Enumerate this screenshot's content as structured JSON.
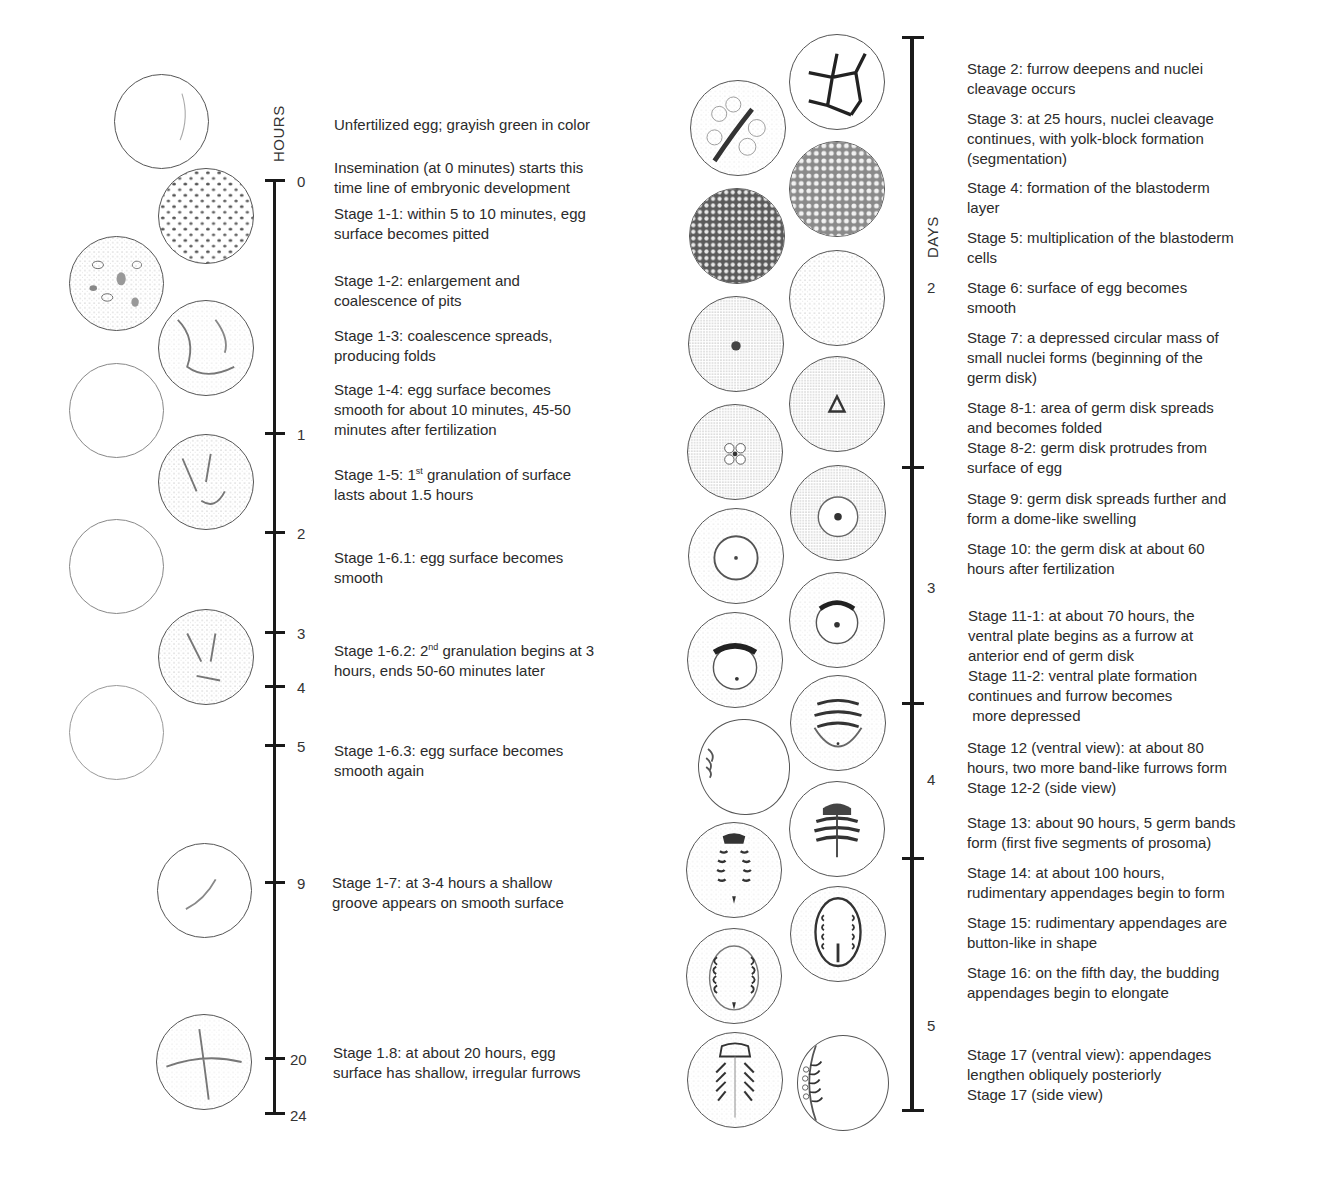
{
  "left_timeline": {
    "axis_title": "HOURS",
    "ticks": [
      {
        "label": "0",
        "y": 180
      },
      {
        "label": "1",
        "y": 433
      },
      {
        "label": "2",
        "y": 532
      },
      {
        "label": "3",
        "y": 632
      },
      {
        "label": "4",
        "y": 686
      },
      {
        "label": "5",
        "y": 745
      },
      {
        "label": "9",
        "y": 882
      },
      {
        "label": "20",
        "y": 1058
      },
      {
        "label": "24",
        "y": 1113
      }
    ],
    "descriptions": [
      {
        "id": "unfertilized",
        "lines": [
          "Unfertilized egg; grayish green in color"
        ]
      },
      {
        "id": "insemination",
        "lines": [
          "Insemination (at 0 minutes) starts this",
          "time line of embryonic development"
        ]
      },
      {
        "id": "stage-1-1",
        "lines": [
          "Stage 1-1: within 5 to 10 minutes, egg",
          "surface becomes pitted"
        ]
      },
      {
        "id": "stage-1-2",
        "lines": [
          "Stage 1-2: enlargement and",
          "coalescence of pits"
        ]
      },
      {
        "id": "stage-1-3",
        "lines": [
          "Stage 1-3: coalescence spreads,",
          "producing folds"
        ]
      },
      {
        "id": "stage-1-4",
        "lines": [
          "Stage 1-4: egg surface becomes",
          "smooth for about 10 minutes, 45-50",
          "minutes after fertilization"
        ]
      },
      {
        "id": "stage-1-5",
        "prefix": "Stage 1-5: 1",
        "sup": "st",
        "suffix": " granulation of surface",
        "line2": "lasts about 1.5 hours"
      },
      {
        "id": "stage-1-6-1",
        "lines": [
          "Stage 1-6.1: egg surface becomes",
          "smooth"
        ]
      },
      {
        "id": "stage-1-6-2",
        "prefix": "Stage 1-6.2: 2",
        "sup": "nd",
        "suffix": " granulation begins at 3",
        "line2": "hours, ends 50-60 minutes later"
      },
      {
        "id": "stage-1-6-3",
        "lines": [
          "Stage 1-6.3: egg surface becomes",
          "smooth again"
        ]
      },
      {
        "id": "stage-1-7",
        "lines": [
          "Stage 1-7: at 3-4 hours a shallow",
          "groove appears on smooth surface"
        ]
      },
      {
        "id": "stage-1-8",
        "lines": [
          "Stage 1.8: at about 20 hours, egg",
          "surface has shallow, irregular furrows"
        ]
      }
    ]
  },
  "right_timeline": {
    "axis_title": "DAYS",
    "ticks": [
      {
        "label": "2",
        "label_y": 287
      },
      {
        "label": "3",
        "label_y": 587
      },
      {
        "label": "4",
        "label_y": 779
      },
      {
        "label": "5",
        "label_y": 1025
      }
    ],
    "descriptions": [
      {
        "id": "stage-2",
        "lines": [
          "Stage 2: furrow deepens and nuclei",
          "cleavage occurs"
        ]
      },
      {
        "id": "stage-3",
        "lines": [
          "Stage 3: at 25 hours, nuclei cleavage",
          "continues, with yolk-block formation",
          "(segmentation)"
        ]
      },
      {
        "id": "stage-4",
        "lines": [
          "Stage 4: formation of the blastoderm",
          "layer"
        ]
      },
      {
        "id": "stage-5",
        "lines": [
          "Stage 5: multiplication of the blastoderm",
          "cells"
        ]
      },
      {
        "id": "stage-6",
        "lines": [
          "Stage 6: surface of egg becomes",
          "smooth"
        ]
      },
      {
        "id": "stage-7",
        "lines": [
          "Stage 7: a depressed circular mass of",
          "small nuclei forms (beginning of the",
          "germ disk)"
        ]
      },
      {
        "id": "stage-8",
        "lines": [
          "Stage 8-1: area of germ disk spreads",
          "and becomes folded",
          "Stage 8-2: germ disk protrudes from",
          "surface of egg"
        ]
      },
      {
        "id": "stage-9",
        "lines": [
          "Stage 9: germ disk spreads further and",
          "form a dome-like swelling"
        ]
      },
      {
        "id": "stage-10",
        "lines": [
          "Stage 10: the germ disk at about 60",
          "hours after fertilization"
        ]
      },
      {
        "id": "stage-11",
        "lines": [
          "Stage 11-1: at about 70 hours, the",
          "ventral plate begins as a furrow at",
          "anterior end of germ disk",
          "Stage 11-2: ventral plate formation",
          "continues and furrow becomes",
          " more depressed"
        ]
      },
      {
        "id": "stage-12",
        "lines": [
          "Stage 12 (ventral view): at about 80",
          "hours, two more band-like furrows form",
          "Stage 12-2 (side view)"
        ]
      },
      {
        "id": "stage-13",
        "lines": [
          "Stage 13: about 90 hours, 5 germ bands",
          "form (first five segments of prosoma)"
        ]
      },
      {
        "id": "stage-14",
        "lines": [
          "Stage 14: at about 100 hours,",
          "rudimentary appendages begin to form"
        ]
      },
      {
        "id": "stage-15",
        "lines": [
          "Stage 15: rudimentary appendages are",
          "button-like in shape"
        ]
      },
      {
        "id": "stage-16",
        "lines": [
          "Stage 16: on the fifth day, the budding",
          "appendages begin to elongate"
        ]
      },
      {
        "id": "stage-17",
        "lines": [
          "Stage 17 (ventral view): appendages",
          "lengthen obliquely posteriorly",
          "Stage 17 (side view)"
        ]
      }
    ]
  },
  "colors": {
    "ink": "#1a1a1a",
    "text": "#2b2b2b",
    "background": "#ffffff"
  }
}
